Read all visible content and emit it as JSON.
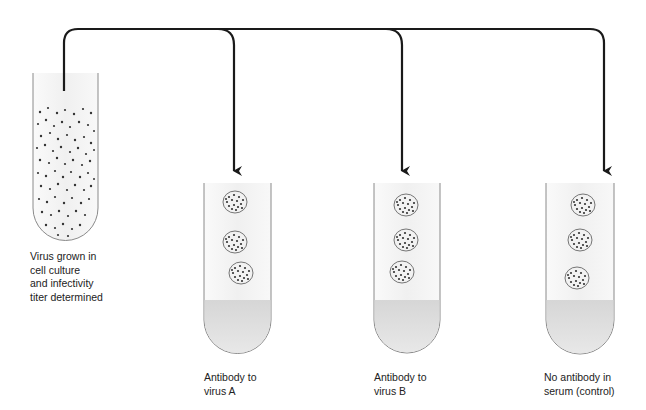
{
  "diagram": {
    "source_tube": {
      "label": "Virus grown in\ncell culture\nand infectivity\ntiter determined"
    },
    "tubes": [
      {
        "id": "A",
        "label": "Antibody to\nvirus A"
      },
      {
        "id": "B",
        "label": "Antibody to\nvirus B"
      },
      {
        "id": "C",
        "label": "No antibody in\nserum (control)"
      }
    ],
    "colors": {
      "line": "#1a1a1a",
      "tube_outline": "#8a8a8a",
      "tube_fill": "#f4f4f4",
      "liquid": "#dcdcdc",
      "dots": "#333333"
    }
  }
}
